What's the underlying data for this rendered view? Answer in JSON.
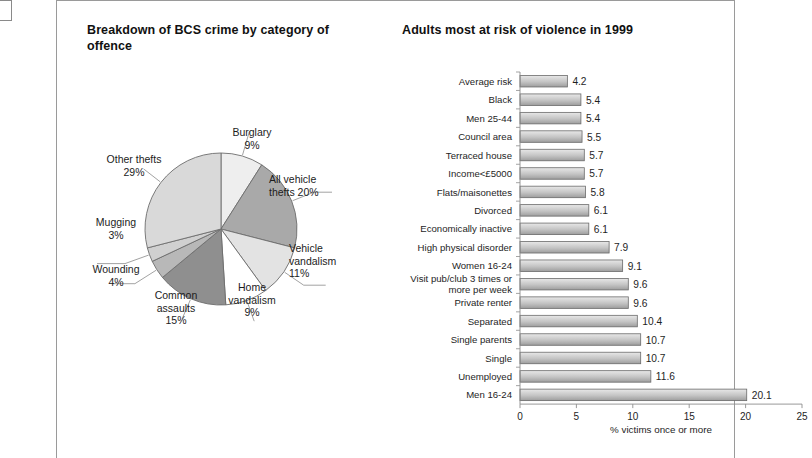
{
  "page": {
    "background": "#ffffff",
    "panel_border": "#9a9a9a"
  },
  "pie_figure": {
    "title": "Breakdown of BCS crime by category of offence"
  },
  "bar_figure": {
    "title": "Adults most at risk of violence in 1999"
  },
  "chart_data": [
    {
      "type": "pie",
      "title": "Breakdown of BCS crime by category of offence",
      "unit": "%",
      "labels": [
        "Burglary",
        "All vehicle thefts",
        "Vehicle vandalism",
        "Home vandalism",
        "Common assaults",
        "Wounding",
        "Mugging",
        "Other thefts"
      ],
      "values": [
        9,
        20,
        11,
        9,
        15,
        4,
        3,
        29
      ],
      "label_texts": [
        "Burglary\n9%",
        "All vehicle\nthefts 20%",
        "Vehicle\nvandalism\n11%",
        "Home\nvandalism\n9%",
        "Common\nassaults\n15%",
        "Wounding\n4%",
        "Mugging\n3%",
        "Other thefts\n29%"
      ],
      "slice_colors": [
        "#eeeeee",
        "#a9a9a9",
        "#e3e3e3",
        "#ffffff",
        "#8f8f8f",
        "#b8b8b8",
        "#d0d0d0",
        "#d9d9d9"
      ],
      "legend": "none",
      "grid": false
    },
    {
      "type": "bar",
      "orientation": "horizontal",
      "title": "Adults most at risk of violence in 1999",
      "xlabel": "% victims once or more",
      "ylabel": "",
      "xlim": [
        0,
        25
      ],
      "xticks": [
        0,
        5,
        10,
        15,
        20,
        25
      ],
      "grid": false,
      "legend": "none",
      "bar_fill_top": "#e8e8e8",
      "bar_fill_bottom": "#9d9d9d",
      "bar_stroke": "#6a6a6a",
      "categories": [
        "Average risk",
        "Black",
        "Men 25-44",
        "Council area",
        "Terraced house",
        "Income<£5000",
        "Flats/maisonettes",
        "Divorced",
        "Economically inactive",
        "High physical disorder",
        "Women 16-24",
        "Visit pub/club 3 times or more per week",
        "Private renter",
        "Separated",
        "Single parents",
        "Single",
        "Unemployed",
        "Men 16-24"
      ],
      "values": [
        4.2,
        5.4,
        5.4,
        5.5,
        5.7,
        5.7,
        5.8,
        6.1,
        6.1,
        7.9,
        9.1,
        9.6,
        9.6,
        10.4,
        10.7,
        10.7,
        11.6,
        20.1
      ],
      "value_labels": [
        "4.2",
        "5.4",
        "5.4",
        "5.5",
        "5.7",
        "5.7",
        "5.8",
        "6.1",
        "6.1",
        "7.9",
        "9.1",
        "9.6",
        "9.6",
        "10.4",
        "10.7",
        "10.7",
        "11.6",
        "20.1"
      ]
    }
  ]
}
